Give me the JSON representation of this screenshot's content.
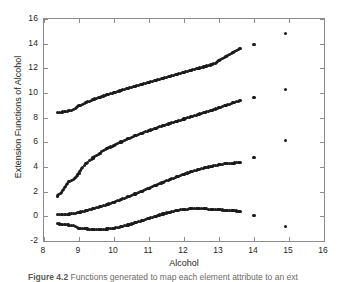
{
  "figure": {
    "caption_number": "Figure 4.2",
    "caption_text": "Functions generated to map each element attribute to an ext"
  },
  "chart_data": {
    "type": "scatter",
    "title": "",
    "xlabel": "Alcohol",
    "ylabel": "Extension Functions of Alcohol",
    "xlim": [
      8,
      16
    ],
    "ylim": [
      -2,
      16
    ],
    "xticks": [
      8,
      9,
      10,
      11,
      12,
      13,
      14,
      15,
      16
    ],
    "yticks": [
      -2,
      0,
      2,
      4,
      6,
      8,
      10,
      12,
      14,
      16
    ],
    "grid": false,
    "legend": "none",
    "marker": "filled-circle",
    "marker_color": "#1a1a1a",
    "axis_color": "#8c8c8c",
    "background": "#ffffff",
    "series": [
      {
        "name": "extension-function-1",
        "x": [
          8.38,
          8.45,
          8.62,
          8.7,
          8.78,
          8.85,
          9.0,
          9.05,
          9.1,
          9.15,
          9.2,
          9.25,
          9.3,
          9.35,
          9.4,
          9.45,
          9.5,
          9.55,
          9.6,
          9.65,
          9.7,
          9.75,
          9.8,
          9.85,
          9.9,
          9.95,
          10.0,
          10.1,
          10.2,
          10.3,
          10.4,
          10.5,
          10.6,
          10.7,
          10.8,
          10.9,
          11.0,
          11.1,
          11.2,
          11.3,
          11.4,
          11.5,
          11.6,
          11.7,
          11.8,
          11.9,
          12.0,
          12.1,
          12.2,
          12.3,
          12.4,
          12.5,
          12.6,
          12.7,
          12.8,
          12.9,
          13.0,
          13.1,
          13.2,
          13.3,
          13.4,
          13.5,
          13.6,
          14.0,
          14.9
        ],
        "y": [
          8.4,
          8.42,
          8.5,
          8.55,
          8.6,
          8.65,
          8.95,
          9.02,
          9.09,
          9.16,
          9.22,
          9.28,
          9.34,
          9.4,
          9.46,
          9.51,
          9.56,
          9.61,
          9.66,
          9.71,
          9.76,
          9.8,
          9.85,
          9.9,
          9.94,
          9.99,
          10.03,
          10.12,
          10.21,
          10.3,
          10.38,
          10.47,
          10.55,
          10.63,
          10.71,
          10.79,
          10.87,
          10.95,
          11.03,
          11.11,
          11.19,
          11.27,
          11.35,
          11.43,
          11.51,
          11.59,
          11.67,
          11.75,
          11.83,
          11.91,
          11.99,
          12.07,
          12.15,
          12.23,
          12.31,
          12.4,
          12.6,
          12.78,
          12.96,
          13.14,
          13.3,
          13.45,
          13.58,
          13.95,
          14.85
        ]
      },
      {
        "name": "extension-function-2",
        "x": [
          8.38,
          8.5,
          8.7,
          8.78,
          8.85,
          9.0,
          9.05,
          9.1,
          9.15,
          9.2,
          9.25,
          9.3,
          9.35,
          9.4,
          9.45,
          9.5,
          9.55,
          9.6,
          9.65,
          9.7,
          9.75,
          9.8,
          9.85,
          9.9,
          9.95,
          10.0,
          10.1,
          10.2,
          10.3,
          10.4,
          10.5,
          10.6,
          10.7,
          10.8,
          10.9,
          11.0,
          11.1,
          11.2,
          11.3,
          11.4,
          11.5,
          11.6,
          11.7,
          11.8,
          11.9,
          12.0,
          12.1,
          12.2,
          12.3,
          12.4,
          12.5,
          12.6,
          12.7,
          12.8,
          12.9,
          13.0,
          13.1,
          13.2,
          13.3,
          13.4,
          13.5,
          13.6,
          14.0,
          14.9
        ],
        "y": [
          1.65,
          1.95,
          2.8,
          2.9,
          2.95,
          3.45,
          3.75,
          3.95,
          4.1,
          4.25,
          4.38,
          4.5,
          4.62,
          4.73,
          4.84,
          4.94,
          5.04,
          5.13,
          5.22,
          5.31,
          5.39,
          5.47,
          5.55,
          5.62,
          5.69,
          5.76,
          5.9,
          6.03,
          6.16,
          6.28,
          6.4,
          6.52,
          6.63,
          6.74,
          6.85,
          6.95,
          7.05,
          7.15,
          7.25,
          7.35,
          7.44,
          7.53,
          7.62,
          7.71,
          7.8,
          7.89,
          7.98,
          8.07,
          8.16,
          8.25,
          8.34,
          8.43,
          8.52,
          8.61,
          8.7,
          8.8,
          8.9,
          9.0,
          9.1,
          9.2,
          9.3,
          9.38,
          9.65,
          10.25
        ]
      },
      {
        "name": "extension-function-3",
        "x": [
          8.38,
          8.45,
          8.62,
          8.7,
          8.78,
          8.85,
          9.0,
          9.1,
          9.2,
          9.3,
          9.4,
          9.5,
          9.6,
          9.7,
          9.8,
          9.9,
          10.0,
          10.1,
          10.2,
          10.3,
          10.4,
          10.5,
          10.6,
          10.7,
          10.8,
          10.9,
          11.0,
          11.1,
          11.2,
          11.3,
          11.4,
          11.5,
          11.6,
          11.7,
          11.8,
          11.9,
          12.0,
          12.1,
          12.2,
          12.3,
          12.4,
          12.5,
          12.6,
          12.7,
          12.8,
          12.9,
          13.0,
          13.1,
          13.2,
          13.3,
          13.4,
          13.5,
          13.6,
          14.0,
          14.9
        ],
        "y": [
          0.16,
          0.16,
          0.18,
          0.18,
          0.2,
          0.2,
          0.32,
          0.38,
          0.45,
          0.52,
          0.6,
          0.68,
          0.77,
          0.86,
          0.95,
          1.05,
          1.15,
          1.25,
          1.36,
          1.47,
          1.58,
          1.7,
          1.81,
          1.93,
          2.05,
          2.17,
          2.29,
          2.41,
          2.53,
          2.65,
          2.76,
          2.88,
          2.99,
          3.1,
          3.21,
          3.31,
          3.41,
          3.51,
          3.6,
          3.69,
          3.77,
          3.85,
          3.93,
          4.0,
          4.07,
          4.13,
          4.18,
          4.23,
          4.27,
          4.3,
          4.32,
          4.33,
          4.33,
          4.8,
          6.15
        ]
      },
      {
        "name": "extension-function-4",
        "x": [
          8.38,
          8.45,
          8.62,
          8.7,
          8.78,
          8.85,
          9.0,
          9.1,
          9.2,
          9.3,
          9.4,
          9.5,
          9.6,
          9.7,
          9.8,
          9.9,
          10.0,
          10.1,
          10.2,
          10.3,
          10.4,
          10.5,
          10.6,
          10.7,
          10.8,
          10.9,
          11.0,
          11.1,
          11.2,
          11.3,
          11.4,
          11.5,
          11.6,
          11.7,
          11.8,
          11.9,
          12.0,
          12.1,
          12.2,
          12.3,
          12.4,
          12.5,
          12.6,
          12.7,
          12.8,
          12.9,
          13.0,
          13.1,
          13.2,
          13.3,
          13.4,
          13.5,
          13.6,
          14.0,
          14.9
        ],
        "y": [
          -0.6,
          -0.62,
          -0.68,
          -0.7,
          -0.72,
          -0.74,
          -0.95,
          -0.99,
          -1.02,
          -1.04,
          -1.05,
          -1.06,
          -1.06,
          -1.05,
          -1.03,
          -1.0,
          -0.96,
          -0.91,
          -0.85,
          -0.78,
          -0.7,
          -0.62,
          -0.53,
          -0.44,
          -0.35,
          -0.26,
          -0.16,
          -0.07,
          0.02,
          0.11,
          0.19,
          0.27,
          0.34,
          0.41,
          0.47,
          0.52,
          0.56,
          0.59,
          0.61,
          0.62,
          0.62,
          0.62,
          0.61,
          0.59,
          0.57,
          0.55,
          0.53,
          0.51,
          0.49,
          0.47,
          0.45,
          0.43,
          0.41,
          0.05,
          -0.8
        ]
      }
    ]
  }
}
